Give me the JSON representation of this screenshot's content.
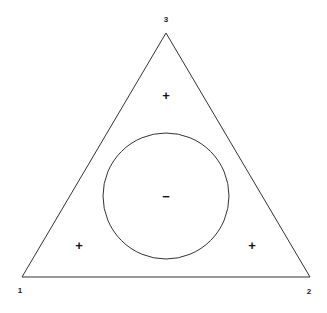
{
  "figure": {
    "background_color": "#ffffff",
    "line_color": "#333333",
    "line_width": 1,
    "width": 327,
    "height": 313
  },
  "triangle": {
    "name": "triangle-outline",
    "vertices": [
      {
        "id": "v1",
        "label": "1",
        "x": 22,
        "y": 277,
        "label_x": 20,
        "label_y": 291
      },
      {
        "id": "v2",
        "label": "2",
        "x": 310,
        "y": 277,
        "label_x": 309,
        "label_y": 292
      },
      {
        "id": "v3",
        "label": "3",
        "x": 166,
        "y": 33,
        "label_x": 166,
        "label_y": 20
      }
    ],
    "points_path": "166,33 310,277 22,277"
  },
  "circle": {
    "name": "inscribed-circle",
    "center_x": 166,
    "center_y": 196,
    "radius": 63
  },
  "markers": [
    {
      "id": "m-top",
      "sign": "+",
      "x": 166,
      "y": 95
    },
    {
      "id": "m-center",
      "sign": "−",
      "x": 166,
      "y": 196
    },
    {
      "id": "m-bottom-left",
      "sign": "+",
      "x": 79,
      "y": 245
    },
    {
      "id": "m-bottom-right",
      "sign": "+",
      "x": 252,
      "y": 245
    }
  ],
  "chart_data": {
    "type": "scatter",
    "title": "",
    "subtitle": "",
    "xlabel": "",
    "ylabel": "",
    "grid": false,
    "legend": "none",
    "shapes": [
      {
        "kind": "triangle",
        "label": "triangle-outline",
        "vertices": [
          [
            22,
            277
          ],
          [
            310,
            277
          ],
          [
            166,
            33
          ]
        ],
        "vertex_labels": [
          "1",
          "2",
          "3"
        ],
        "stroke": "#333333",
        "fill": "none"
      },
      {
        "kind": "circle",
        "label": "inscribed-circle",
        "center": [
          166,
          196
        ],
        "radius": 63,
        "stroke": "#333333",
        "fill": "none"
      }
    ],
    "annotations": [
      {
        "text": "3",
        "x": 166,
        "y": 20,
        "role": "vertex-label"
      },
      {
        "text": "1",
        "x": 20,
        "y": 291,
        "role": "vertex-label"
      },
      {
        "text": "2",
        "x": 309,
        "y": 292,
        "role": "vertex-label"
      },
      {
        "text": "+",
        "x": 166,
        "y": 95,
        "role": "region-sign"
      },
      {
        "text": "−",
        "x": 166,
        "y": 196,
        "role": "region-sign"
      },
      {
        "text": "+",
        "x": 79,
        "y": 245,
        "role": "region-sign"
      },
      {
        "text": "+",
        "x": 252,
        "y": 245,
        "role": "region-sign"
      }
    ],
    "xlim": [
      0,
      327
    ],
    "ylim": [
      0,
      313
    ]
  }
}
